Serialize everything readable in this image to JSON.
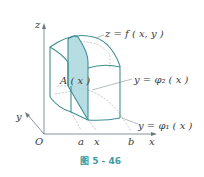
{
  "figure": {
    "caption": "图 5 - 46",
    "colors": {
      "edge": "#3f8f93",
      "fill": "#a9d7dc",
      "axis": "#6a7a7c",
      "dashed": "#9aa7a8",
      "caption": "#3f9a9e"
    },
    "axes": {
      "z_label": "z",
      "y_label": "y",
      "x_label": "x",
      "origin_label": "O"
    },
    "ticks": {
      "a": "a",
      "x": "x",
      "b": "b"
    },
    "labels": {
      "surface": "z = f ( x,  y )",
      "upper_curve": "y = φ₂ ( x )",
      "lower_curve": "y = φ₁ ( x )",
      "cross_section": "A ( x )"
    }
  }
}
